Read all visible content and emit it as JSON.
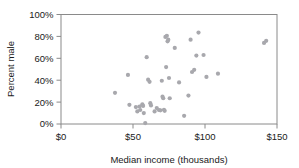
{
  "chart_data": {
    "type": "scatter",
    "title": "",
    "xlabel": "Median income (thousands)",
    "ylabel": "Percent male",
    "xlim": [
      0,
      150
    ],
    "ylim": [
      0,
      100
    ],
    "grid": false,
    "legend": null,
    "xticks": [
      0,
      50,
      100,
      150
    ],
    "xtick_labels": [
      "$0",
      "$50",
      "$100",
      "$150"
    ],
    "yticks": [
      0,
      20,
      40,
      60,
      80,
      100
    ],
    "ytick_labels": [
      "0%",
      "20%",
      "40%",
      "60%",
      "80%",
      "100%"
    ],
    "marker_color": "#a8a8ad",
    "marker_size": 2.1,
    "points": [
      [
        37.5,
        28.5
      ],
      [
        46.5,
        44.8
      ],
      [
        47.5,
        17.5
      ],
      [
        52.0,
        15.5
      ],
      [
        53.0,
        11.5
      ],
      [
        54.5,
        16.0
      ],
      [
        55.0,
        12.8
      ],
      [
        56.5,
        18.0
      ],
      [
        57.0,
        16.5
      ],
      [
        57.5,
        10.0
      ],
      [
        58.5,
        0.8
      ],
      [
        59.5,
        61.0
      ],
      [
        60.5,
        40.5
      ],
      [
        61.5,
        38.5
      ],
      [
        62.0,
        19.0
      ],
      [
        62.5,
        17.0
      ],
      [
        65.0,
        11.5
      ],
      [
        66.5,
        14.5
      ],
      [
        68.0,
        12.8
      ],
      [
        69.0,
        12.5
      ],
      [
        70.0,
        39.5
      ],
      [
        70.5,
        25.0
      ],
      [
        71.0,
        23.5
      ],
      [
        71.5,
        13.0
      ],
      [
        72.0,
        12.0
      ],
      [
        72.5,
        79.5
      ],
      [
        73.0,
        52.0
      ],
      [
        73.5,
        80.5
      ],
      [
        74.0,
        75.5
      ],
      [
        74.5,
        77.0
      ],
      [
        75.0,
        42.0
      ],
      [
        75.5,
        23.5
      ],
      [
        79.0,
        69.5
      ],
      [
        82.0,
        38.0
      ],
      [
        85.5,
        7.5
      ],
      [
        88.5,
        26.0
      ],
      [
        90.0,
        77.0
      ],
      [
        91.0,
        47.5
      ],
      [
        92.5,
        49.5
      ],
      [
        94.0,
        62.5
      ],
      [
        95.5,
        83.5
      ],
      [
        99.0,
        63.0
      ],
      [
        101.0,
        43.0
      ],
      [
        109.0,
        46.0
      ],
      [
        141.0,
        74.0
      ],
      [
        142.5,
        76.0
      ]
    ]
  },
  "axes": {
    "x_title": "Median income (thousands)",
    "y_title": "Percent male"
  }
}
